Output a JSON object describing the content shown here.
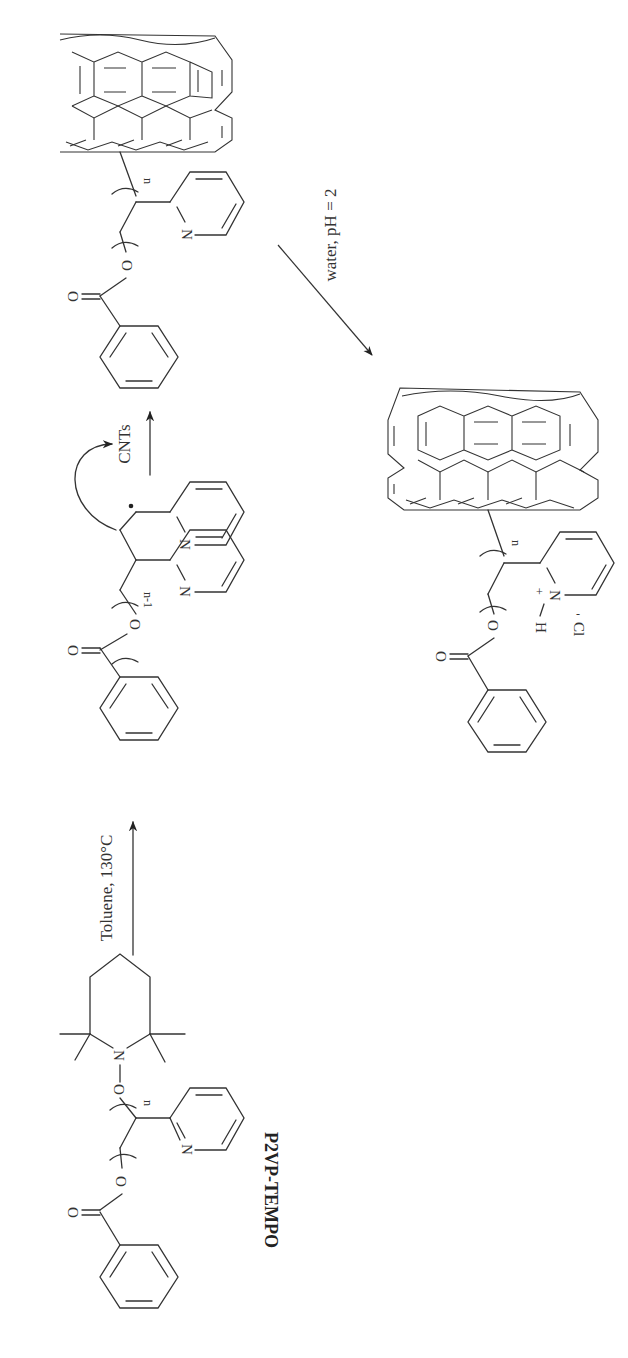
{
  "scheme": {
    "title": "P2VP grafting to CNTs reaction scheme",
    "reagent_label": "P2VP-TEMPO",
    "steps": [
      {
        "conditions": "Toluene, 130°C"
      },
      {
        "conditions": "CNTs"
      },
      {
        "conditions": "water, pH = 2"
      }
    ],
    "atoms": {
      "nitrogen": "N",
      "oxygen": "O",
      "hydrogen": "H",
      "plus": "+",
      "chloride": "Cl",
      "minus": "-"
    },
    "repeat_labels": {
      "n": "n",
      "n_minus_1": "n-1"
    }
  }
}
